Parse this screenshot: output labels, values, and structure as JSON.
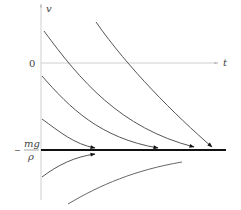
{
  "diagram": {
    "axes": {
      "vertical_label": "v",
      "horizontal_label": "t",
      "origin_label": "0"
    },
    "equilibrium": {
      "sign": "−",
      "numerator": "mg",
      "denominator": "ρ"
    },
    "solution_curves": [
      {
        "name": "curve-1",
        "direction": "decreasing",
        "approaches": "equilibrium"
      },
      {
        "name": "curve-2",
        "direction": "decreasing",
        "approaches": "equilibrium"
      },
      {
        "name": "curve-3",
        "direction": "decreasing",
        "approaches": "equilibrium"
      },
      {
        "name": "curve-4",
        "direction": "decreasing",
        "approaches": "equilibrium"
      },
      {
        "name": "curve-5",
        "direction": "increasing",
        "approaches": "equilibrium"
      },
      {
        "name": "curve-6",
        "direction": "increasing",
        "approaches": "equilibrium"
      }
    ],
    "colors": {
      "axis": "#c8c8c8",
      "curve": "#555555",
      "equilibrium": "#111111",
      "text": "#444444"
    }
  }
}
